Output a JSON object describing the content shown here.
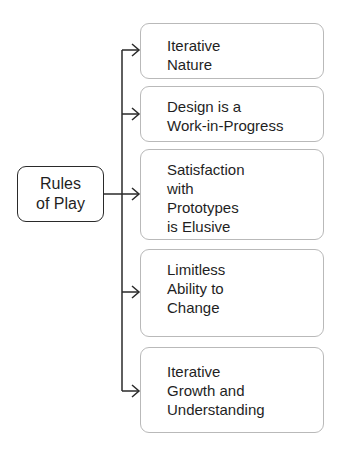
{
  "diagram": {
    "root": {
      "label": "Rules\nof Play"
    },
    "children": [
      {
        "label": "Iterative\nNature"
      },
      {
        "label": "Design is a\nWork-in-Progress"
      },
      {
        "label": "Satisfaction\nwith\nPrototypes\nis Elusive"
      },
      {
        "label": "Limitless\nAbility to\nChange"
      },
      {
        "label": "Iterative\nGrowth and\nUnderstanding"
      }
    ],
    "colors": {
      "line": "#2a2a2a",
      "node_border": "#b9b9b9",
      "root_border": "#2a2a2a"
    }
  }
}
